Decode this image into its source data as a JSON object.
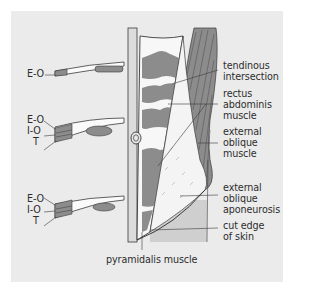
{
  "figure": {
    "left_section_labels": [
      {
        "rows": [
          "E-O"
        ]
      },
      {
        "rows": [
          "E-O",
          "I-O",
          "T"
        ]
      },
      {
        "rows": [
          "E-O",
          "I-O",
          "T"
        ]
      }
    ],
    "right_labels": {
      "tendinous_intersection": [
        "tendinous",
        "intersection"
      ],
      "rectus_abdominis": [
        "rectus",
        "abdominis",
        "muscle"
      ],
      "external_oblique_muscle": [
        "external",
        "oblique",
        "muscle"
      ],
      "external_oblique_aponeurosis": [
        "external",
        "oblique",
        "aponeurosis"
      ],
      "cut_edge_of_skin": [
        "cut edge",
        "of skin"
      ]
    },
    "bottom_label": "pyramidalis muscle",
    "colors": {
      "panel_bg": "#ebebeb",
      "muscle": "#8c8c8c",
      "muscle_dark": "#6e6e6e",
      "skin_shade": "#cfcfcf",
      "outline": "#3a3a3a",
      "aponeurosis": "#f4f4f4"
    }
  }
}
